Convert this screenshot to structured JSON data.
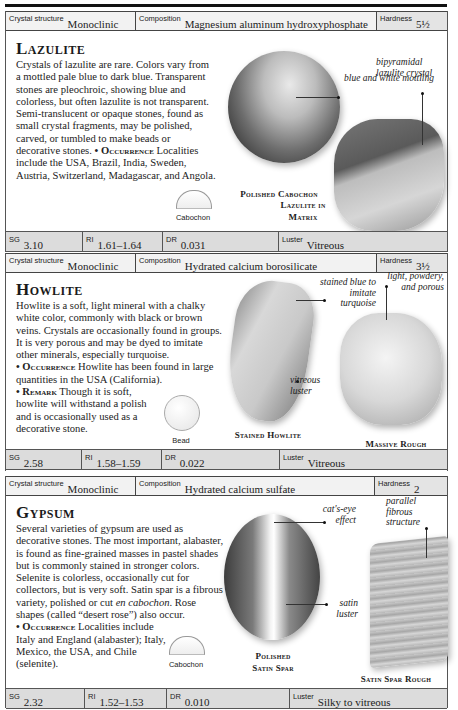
{
  "entries": [
    {
      "name": "Lazulite",
      "crystal_structure": {
        "label": "Crystal structure",
        "value": "Monoclinic"
      },
      "composition": {
        "label": "Composition",
        "value": "Magnesium aluminum hydroxyphosphate"
      },
      "hardness": {
        "label": "Hardness",
        "value": "5½"
      },
      "description": "Crystals of lazulite are rare. Colors vary from a mottled pale blue to dark blue. Transparent stones are pleochroic, showing blue and colorless, but often lazulite is not transparent. Semi-translucent or opaque stones, found as small crystal fragments, may be polished, carved, or tumbled to make beads or decorative stones.",
      "occurrence_label": "• Occurrence",
      "occurrence": "Localities include the USA, Brazil, India, Sweden, Austria, Switzerland, Madagascar, and Angola.",
      "cut_shape": "Cabochon",
      "images": [
        {
          "caption": "Polished Cabochon",
          "note": "blue and white mottling"
        },
        {
          "caption": "Lazulite in Matrix",
          "note": "bipyramidal lazulite crystal"
        }
      ],
      "sg": {
        "label": "SG",
        "value": "3.10"
      },
      "ri": {
        "label": "RI",
        "value": "1.61–1.64"
      },
      "dr": {
        "label": "DR",
        "value": "0.031"
      },
      "luster": {
        "label": "Luster",
        "value": "Vitreous"
      }
    },
    {
      "name": "Howlite",
      "crystal_structure": {
        "label": "Crystal structure",
        "value": "Monoclinic"
      },
      "composition": {
        "label": "Composition",
        "value": "Hydrated calcium borosilicate"
      },
      "hardness": {
        "label": "Hardness",
        "value": "3½"
      },
      "description": "Howlite is a soft, light mineral with a chalky white color, commonly with black or brown veins. Crystals are occasionally found in groups. It is very porous and may be dyed to imitate other minerals, especially turquoise.",
      "occurrence_label": "• Occurrence",
      "occurrence": "Howlite has been found in large quantities in the USA (California).",
      "remark_label": "• Remark",
      "remark": "Though it is soft, howlite will withstand a polish and is occasionally used as a decorative stone.",
      "cut_shape": "Bead",
      "images": [
        {
          "caption": "Stained Howlite",
          "notes": [
            "stained blue to imitate turquoise",
            "vitreous luster"
          ]
        },
        {
          "caption": "Massive Rough",
          "note": "light, powdery, and porous"
        }
      ],
      "sg": {
        "label": "SG",
        "value": "2.58"
      },
      "ri": {
        "label": "RI",
        "value": "1.58–1.59"
      },
      "dr": {
        "label": "DR",
        "value": "0.022"
      },
      "luster": {
        "label": "Luster",
        "value": "Vitreous"
      }
    },
    {
      "name": "Gypsum",
      "crystal_structure": {
        "label": "Crystal structure",
        "value": "Monoclinic"
      },
      "composition": {
        "label": "Composition",
        "value": "Hydrated calcium sulfate"
      },
      "hardness": {
        "label": "Hardness",
        "value": "2"
      },
      "description_1": "Several varieties of gypsum are used as decorative stones. The most important, alabaster, is found as fine-grained masses in pastel shades but is commonly stained in stronger colors. Selenite is colorless, occasionally cut for collectors, but is very soft. Satin spar is a fibrous variety, polished or cut ",
      "description_em": "en cabochon",
      "description_2": ". Rose shapes (called “desert rose”) also occur.",
      "occurrence_label": "• Occurrence",
      "occurrence": "Localities include Italy and England (alabaster); Italy, Mexico, the USA, and Chile (selenite).",
      "cut_shape": "Cabochon",
      "images": [
        {
          "caption_1": "Polished",
          "caption_2": "Satin Spar",
          "notes": [
            "cat's-eye effect",
            "satin luster"
          ]
        },
        {
          "caption": "Satin Spar Rough",
          "note": "parallel fibrous structure"
        }
      ],
      "sg": {
        "label": "SG",
        "value": "2.32"
      },
      "ri": {
        "label": "RI",
        "value": "1.52–1.53"
      },
      "dr": {
        "label": "DR",
        "value": "0.010"
      },
      "luster": {
        "label": "Luster",
        "value": "Silky to vitreous"
      }
    }
  ]
}
